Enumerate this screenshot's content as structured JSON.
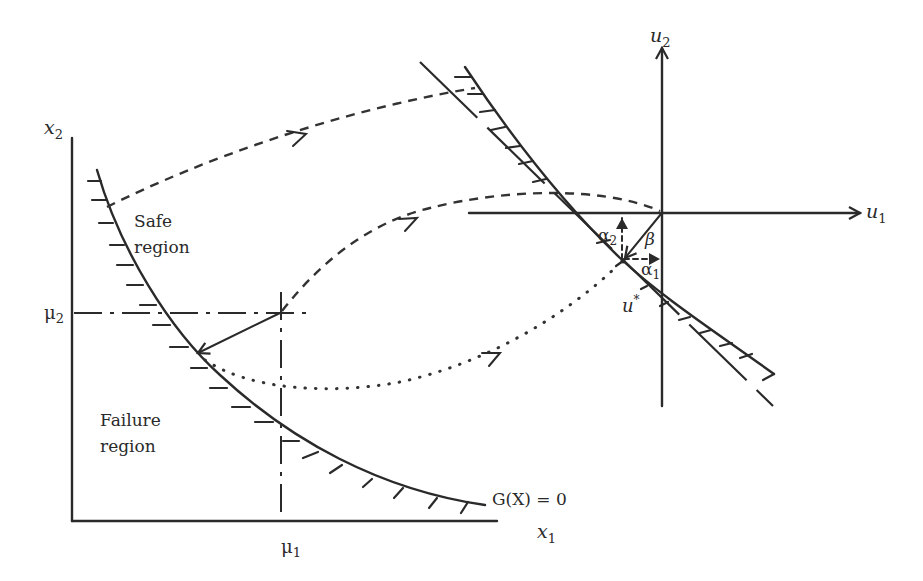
{
  "figure": {
    "x_space": {
      "x_axis_label": "x",
      "x_axis_sub": "1",
      "y_axis_label": "x",
      "y_axis_sub": "2",
      "mean_x_label": "μ",
      "mean_x_sub": "1",
      "mean_y_label": "μ",
      "mean_y_sub": "2",
      "safe_region_line1": "Safe",
      "safe_region_line2": "region",
      "failure_region_line1": "Failure",
      "failure_region_line2": "region",
      "limit_state_label": "G(X) = 0"
    },
    "u_space": {
      "u1_label": "u",
      "u1_sub": "1",
      "u2_label": "u",
      "u2_sub": "2",
      "beta_label": "β",
      "alpha1_label": "α",
      "alpha1_sub": "1",
      "alpha2_label": "α",
      "alpha2_sub": "2",
      "design_point_label": "u",
      "design_point_sup": "*"
    },
    "colors": {
      "ink": "#2a2a2a",
      "background": "#ffffff"
    }
  }
}
